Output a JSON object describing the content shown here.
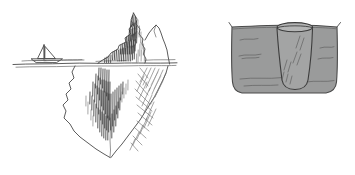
{
  "figure": {
    "title": "Iceberg and submerged glass sketch",
    "background_color": "#ffffff",
    "width": 355,
    "height": 175,
    "style": "hand-drawn pencil sketch",
    "panel_count": 2
  },
  "palette": {
    "paper": "#ffffff",
    "ink": "#4a4a4a",
    "ink_dark": "#2e2e2e",
    "hatch_dark": "#3a3a3a",
    "hatch_mid": "#6a6a6a",
    "hatch_light": "#8d8d8d",
    "liquid_gray": "#9a9b9b",
    "glass_gray": "#a3a4a4",
    "glass_rim_gray": "#b4b5b5"
  },
  "panels": [
    {
      "id": "iceberg-panel",
      "name": "Iceberg with sailboat",
      "bounds": {
        "x": 0,
        "y": 0,
        "width": 178,
        "height": 175
      },
      "elements": [
        {
          "name": "sailboat",
          "label": "Sailboat",
          "x": 40,
          "y": 52,
          "description": "Small boat with two triangular sails at the waterline"
        },
        {
          "name": "waterline",
          "label": "Waterline",
          "y": 63,
          "x_start": 12,
          "x_end": 178,
          "description": "Horizontal sea surface line crossing the panel"
        },
        {
          "name": "iceberg-tip",
          "label": "Iceberg tip above water",
          "peak_x": 133,
          "peak_y": 13,
          "description": "Jagged dark-hatched peak rising above the waterline"
        },
        {
          "name": "iceberg-secondary-peak",
          "label": "Secondary ridge",
          "peak_x": 156,
          "peak_y": 25,
          "description": "Lower rounded ridge to the right of the main peak"
        },
        {
          "name": "iceberg-submerged",
          "label": "Submerged iceberg mass",
          "bottom_y": 158,
          "description": "Large hatched underwater body tapering to a point"
        },
        {
          "name": "hatching-vertical",
          "label": "Vertical pencil hatching",
          "description": "Dense vertical strokes shading the submerged mass"
        },
        {
          "name": "hatching-crosshatch",
          "label": "Cross-hatching",
          "description": "Diagonal cross-hatch shading on the right flank"
        }
      ]
    },
    {
      "id": "glass-panel",
      "name": "Glass submerged in liquid",
      "bounds": {
        "x": 178,
        "y": 0,
        "width": 177,
        "height": 175
      },
      "elements": [
        {
          "name": "tub",
          "label": "Container of liquid",
          "x": 228,
          "y": 22,
          "width": 112,
          "height": 75,
          "description": "Gray-filled basin with flared top lips and rounded bottom"
        },
        {
          "name": "tub-left-lip",
          "label": "Left lip",
          "x": 230,
          "y": 22
        },
        {
          "name": "tub-right-lip",
          "label": "Right lip",
          "x": 338,
          "y": 22
        },
        {
          "name": "glass",
          "label": "Drinking glass",
          "x": 272,
          "y": 24,
          "width": 45,
          "height": 66,
          "description": "Tapered glass standing in the liquid, rim above the surface"
        },
        {
          "name": "glass-rim",
          "label": "Glass rim",
          "cx": 294,
          "cy": 27,
          "description": "Open elliptical mouth of the glass above the liquid line"
        },
        {
          "name": "liquid-surface-lines",
          "label": "Surface ripple marks",
          "description": "Short curved strokes suggesting liquid surface texture"
        },
        {
          "name": "glass-shine",
          "label": "Glass highlight strokes",
          "description": "Diagonal pencil strokes indicating reflection on the glass"
        }
      ]
    }
  ]
}
